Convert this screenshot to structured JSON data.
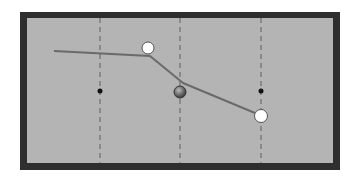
{
  "diagram": {
    "type": "billiards-table-shot-diagram",
    "colors": {
      "background": "#ffffff",
      "frame": "#2e2e2e",
      "felt": "#b4b4b4",
      "dashed_line": "#6e6e6e",
      "path": "#6a6a6a",
      "marker": "#111111",
      "cue_ball": "#ffffff",
      "object_ball": "#6b6b6b"
    },
    "table": {
      "frame": {
        "x": 20,
        "y": 12,
        "width": 320,
        "height": 158
      },
      "felt": {
        "x": 27,
        "y": 18,
        "width": 306,
        "height": 145
      }
    },
    "guide_lines": [
      {
        "x": 100
      },
      {
        "x": 180
      },
      {
        "x": 261
      }
    ],
    "markers": [
      {
        "x": 100,
        "y": 91
      },
      {
        "x": 261,
        "y": 91
      }
    ],
    "balls": [
      {
        "id": "white-ball-top",
        "kind": "white",
        "x": 148,
        "y": 48,
        "r": 6
      },
      {
        "id": "gray-ball-center",
        "kind": "object",
        "x": 180,
        "y": 92,
        "r": 6
      },
      {
        "id": "white-ball-bottom",
        "kind": "white",
        "x": 261,
        "y": 116,
        "r": 6.5
      }
    ],
    "path": {
      "points": [
        [
          54,
          51
        ],
        [
          150,
          56
        ],
        [
          183,
          83
        ],
        [
          255,
          113
        ]
      ]
    }
  }
}
